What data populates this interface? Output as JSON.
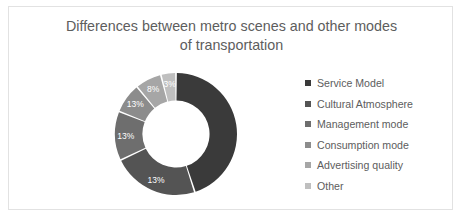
{
  "frame": {
    "border_color": "#e2e2e2",
    "background": "#ffffff"
  },
  "chart_data": {
    "type": "pie",
    "variant": "donut",
    "title": "Differences between metro scenes and other modes of transportation",
    "title_line_1": "Differences between metro scenes and other modes",
    "title_line_2": "of transportation",
    "title_color": "#5d5d5d",
    "xlabel": "",
    "ylabel": "",
    "grid": false,
    "legend_position": "right",
    "start_angle_deg": 0,
    "direction": "clockwise",
    "inner_radius_ratio": 0.55,
    "categories": [
      "Service Model",
      "Cultural Atmosphere",
      "Management mode",
      "Consumption mode",
      "Advertising quality",
      "Other"
    ],
    "values": [
      45,
      13,
      13,
      13,
      8,
      3
    ],
    "labels": [
      "",
      "13%",
      "13%",
      "13%",
      "8%",
      "3%"
    ],
    "colors": [
      "#3a3a3a",
      "#545454",
      "#6e6e6e",
      "#8c8c8c",
      "#a6a6a6",
      "#bfbfbf"
    ],
    "label_color": "#ffffff",
    "slices": [
      {
        "name": "Service Model",
        "value": 45,
        "label": "",
        "color": "#3a3a3a",
        "start_deg": 0,
        "end_deg": 162
      },
      {
        "name": "Cultural Atmosphere",
        "value": 13,
        "label": "13%",
        "color": "#545454",
        "start_deg": 162,
        "end_deg": 244.8
      },
      {
        "name": "Management mode",
        "value": 13,
        "label": "13%",
        "color": "#6e6e6e",
        "start_deg": 244.8,
        "end_deg": 291.6
      },
      {
        "name": "Consumption mode",
        "value": 13,
        "label": "13%",
        "color": "#8c8c8c",
        "start_deg": 291.6,
        "end_deg": 320.4
      },
      {
        "name": "Advertising quality",
        "value": 8,
        "label": "8%",
        "color": "#a6a6a6",
        "start_deg": 320.4,
        "end_deg": 345.6
      },
      {
        "name": "Other",
        "value": 3,
        "label": "3%",
        "color": "#bfbfbf",
        "start_deg": 345.6,
        "end_deg": 360
      }
    ]
  },
  "legend": {
    "items": [
      {
        "label": "Service Model",
        "color": "#3a3a3a"
      },
      {
        "label": "Cultural Atmosphere",
        "color": "#545454"
      },
      {
        "label": "Management mode",
        "color": "#6e6e6e"
      },
      {
        "label": "Consumption mode",
        "color": "#8c8c8c"
      },
      {
        "label": "Advertising quality",
        "color": "#a6a6a6"
      },
      {
        "label": "Other",
        "color": "#bfbfbf"
      }
    ]
  }
}
